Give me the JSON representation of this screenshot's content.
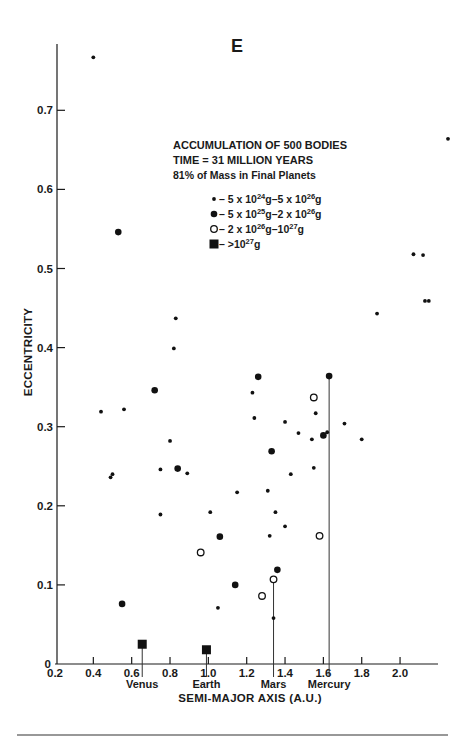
{
  "chart_data": {
    "type": "scatter",
    "title": "E",
    "xlabel": "SEMI-MAJOR AXIS (A.U.)",
    "ylabel": "ECCENTRICITY",
    "xlim": [
      0.2,
      2.2
    ],
    "ylim": [
      0,
      0.78
    ],
    "x_ticks": [
      0.2,
      0.4,
      0.6,
      0.8,
      1.0,
      1.2,
      1.4,
      1.6,
      1.8,
      2.0
    ],
    "x_tick_labels": [
      "0.2",
      "0.4",
      "0.6",
      "0.8",
      "1.0",
      "1.2",
      "1.4",
      "1.6",
      "1.8",
      "2.0"
    ],
    "y_ticks": [
      0,
      0.1,
      0.2,
      0.3,
      0.4,
      0.5,
      0.6,
      0.7
    ],
    "y_tick_labels": [
      "0",
      "0.1",
      "0.2",
      "0.3",
      "0.4",
      "0.5",
      "0.6",
      "0.7"
    ],
    "grid": false,
    "annotation": {
      "line1": "ACCUMULATION OF 500 BODIES",
      "line2": "TIME = 31 MILLION YEARS",
      "line3": "81% of Mass in Final Planets"
    },
    "legend": [
      {
        "marker": "small-dot",
        "text_parts": [
          "– 5 x 10",
          "24",
          "g–5 x 10",
          "26",
          "g"
        ],
        "label": "5 x 10^24g–5 x 10^26g"
      },
      {
        "marker": "large-dot",
        "text_parts": [
          "– 5 x 10",
          "25",
          "g–2 x 10",
          "26",
          "g"
        ],
        "label": "5 x 10^25g–2 x 10^26g"
      },
      {
        "marker": "open-circle",
        "text_parts": [
          "– 2 x 10",
          "26",
          "g–10",
          "27",
          "g"
        ],
        "label": "2 x 10^26g–10^27g"
      },
      {
        "marker": "square",
        "text_parts": [
          "– >10",
          "27",
          "g",
          "",
          ""
        ],
        "label": ">10^27g"
      }
    ],
    "series": [
      {
        "name": "5 x 10^24g–5 x 10^26g",
        "marker": "small-dot",
        "points": [
          [
            0.4,
            0.767
          ],
          [
            2.25,
            0.664
          ],
          [
            2.07,
            0.518
          ],
          [
            2.12,
            0.517
          ],
          [
            2.13,
            0.459
          ],
          [
            2.15,
            0.459
          ],
          [
            1.88,
            0.443
          ],
          [
            0.83,
            0.437
          ],
          [
            0.82,
            0.399
          ],
          [
            1.23,
            0.343
          ],
          [
            0.44,
            0.319
          ],
          [
            0.56,
            0.322
          ],
          [
            1.56,
            0.317
          ],
          [
            1.24,
            0.311
          ],
          [
            1.4,
            0.306
          ],
          [
            1.71,
            0.304
          ],
          [
            1.47,
            0.292
          ],
          [
            1.62,
            0.293
          ],
          [
            1.54,
            0.284
          ],
          [
            1.8,
            0.284
          ],
          [
            0.8,
            0.282
          ],
          [
            0.75,
            0.246
          ],
          [
            0.89,
            0.241
          ],
          [
            0.5,
            0.24
          ],
          [
            0.49,
            0.236
          ],
          [
            1.55,
            0.248
          ],
          [
            1.43,
            0.24
          ],
          [
            1.15,
            0.217
          ],
          [
            1.31,
            0.219
          ],
          [
            0.75,
            0.189
          ],
          [
            1.01,
            0.192
          ],
          [
            1.35,
            0.192
          ],
          [
            1.4,
            0.174
          ],
          [
            1.32,
            0.162
          ],
          [
            1.05,
            0.071
          ],
          [
            1.34,
            0.058
          ]
        ]
      },
      {
        "name": "5 x 10^25g–2 x 10^26g",
        "marker": "large-dot",
        "points": [
          [
            0.53,
            0.546
          ],
          [
            1.26,
            0.363
          ],
          [
            1.63,
            0.364
          ],
          [
            0.72,
            0.346
          ],
          [
            1.6,
            0.289
          ],
          [
            1.33,
            0.269
          ],
          [
            0.84,
            0.247
          ],
          [
            1.06,
            0.161
          ],
          [
            1.36,
            0.119
          ],
          [
            1.14,
            0.1
          ],
          [
            0.55,
            0.076
          ]
        ]
      },
      {
        "name": "2 x 10^26g–10^27g",
        "marker": "open-circle",
        "points": [
          [
            1.55,
            0.337
          ],
          [
            1.58,
            0.162
          ],
          [
            0.96,
            0.141
          ],
          [
            1.34,
            0.107
          ],
          [
            1.28,
            0.086
          ]
        ]
      },
      {
        "name": ">10^27g",
        "marker": "square",
        "points": [
          [
            0.655,
            0.025
          ],
          [
            0.99,
            0.018
          ]
        ]
      }
    ],
    "planet_markers": [
      {
        "name": "Venus",
        "a": 0.655,
        "e_top": 0.025
      },
      {
        "name": "Earth",
        "a": 0.99,
        "e_top": 0.018
      },
      {
        "name": "Mars",
        "a": 1.34,
        "e_top": 0.107
      },
      {
        "name": "Mercury",
        "a": 1.63,
        "e_top": 0.364
      }
    ]
  }
}
